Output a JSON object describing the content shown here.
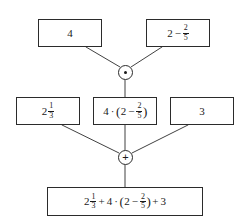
{
  "diagram": {
    "type": "expression-tree",
    "colors": {
      "stroke": "#2b2b2b",
      "text": "#1a1a1a",
      "background": "#ffffff"
    },
    "operators": {
      "multiply": {
        "symbol": "⊙",
        "name": "multiplication-node",
        "glyph": "dot"
      },
      "add": {
        "symbol": "+",
        "name": "addition-node",
        "glyph": "plus"
      }
    },
    "nodes": {
      "top_left": {
        "label": "4",
        "parts": [
          {
            "kind": "text",
            "value": "4"
          }
        ]
      },
      "top_right": {
        "label": "2 − 2/5",
        "parts": [
          {
            "kind": "text",
            "value": "2"
          },
          {
            "kind": "op",
            "value": "−"
          },
          {
            "kind": "frac",
            "num": "2",
            "den": "5"
          }
        ]
      },
      "mid_left": {
        "label": "2 1/3",
        "parts": [
          {
            "kind": "text",
            "value": "2"
          },
          {
            "kind": "frac",
            "num": "1",
            "den": "3"
          }
        ]
      },
      "mid_center": {
        "label": "4 · (2 − 2/5)",
        "parts": [
          {
            "kind": "text",
            "value": "4"
          },
          {
            "kind": "op",
            "value": "·"
          },
          {
            "kind": "paren",
            "value": "("
          },
          {
            "kind": "text",
            "value": "2"
          },
          {
            "kind": "op",
            "value": "−"
          },
          {
            "kind": "frac",
            "num": "2",
            "den": "5"
          },
          {
            "kind": "paren",
            "value": ")"
          }
        ]
      },
      "mid_right": {
        "label": "3",
        "parts": [
          {
            "kind": "text",
            "value": "3"
          }
        ]
      },
      "bottom": {
        "label": "2 1/3 + 4 · (2 − 2/5) + 3",
        "parts": [
          {
            "kind": "text",
            "value": "2"
          },
          {
            "kind": "frac",
            "num": "1",
            "den": "3"
          },
          {
            "kind": "op",
            "value": "+"
          },
          {
            "kind": "text",
            "value": "4"
          },
          {
            "kind": "op",
            "value": "·"
          },
          {
            "kind": "paren",
            "value": "("
          },
          {
            "kind": "text",
            "value": "2"
          },
          {
            "kind": "op",
            "value": "−"
          },
          {
            "kind": "frac",
            "num": "2",
            "den": "5"
          },
          {
            "kind": "paren",
            "value": ")"
          },
          {
            "kind": "op",
            "value": "+"
          },
          {
            "kind": "text",
            "value": "3"
          }
        ]
      }
    },
    "edges": [
      {
        "name": "edge-top-left-to-multiply",
        "x1": 86,
        "y1": 47,
        "x2": 120,
        "y2": 67
      },
      {
        "name": "edge-top-right-to-multiply",
        "x1": 162,
        "y1": 47,
        "x2": 131,
        "y2": 67
      },
      {
        "name": "edge-multiply-to-mid-center",
        "x1": 125,
        "y1": 80,
        "x2": 125,
        "y2": 97
      },
      {
        "name": "edge-mid-left-to-add",
        "x1": 62,
        "y1": 125,
        "x2": 119,
        "y2": 153
      },
      {
        "name": "edge-mid-center-to-add",
        "x1": 125,
        "y1": 125,
        "x2": 125,
        "y2": 150
      },
      {
        "name": "edge-mid-right-to-add",
        "x1": 188,
        "y1": 125,
        "x2": 132,
        "y2": 153
      },
      {
        "name": "edge-add-to-bottom",
        "x1": 125,
        "y1": 165,
        "x2": 125,
        "y2": 187
      }
    ]
  }
}
